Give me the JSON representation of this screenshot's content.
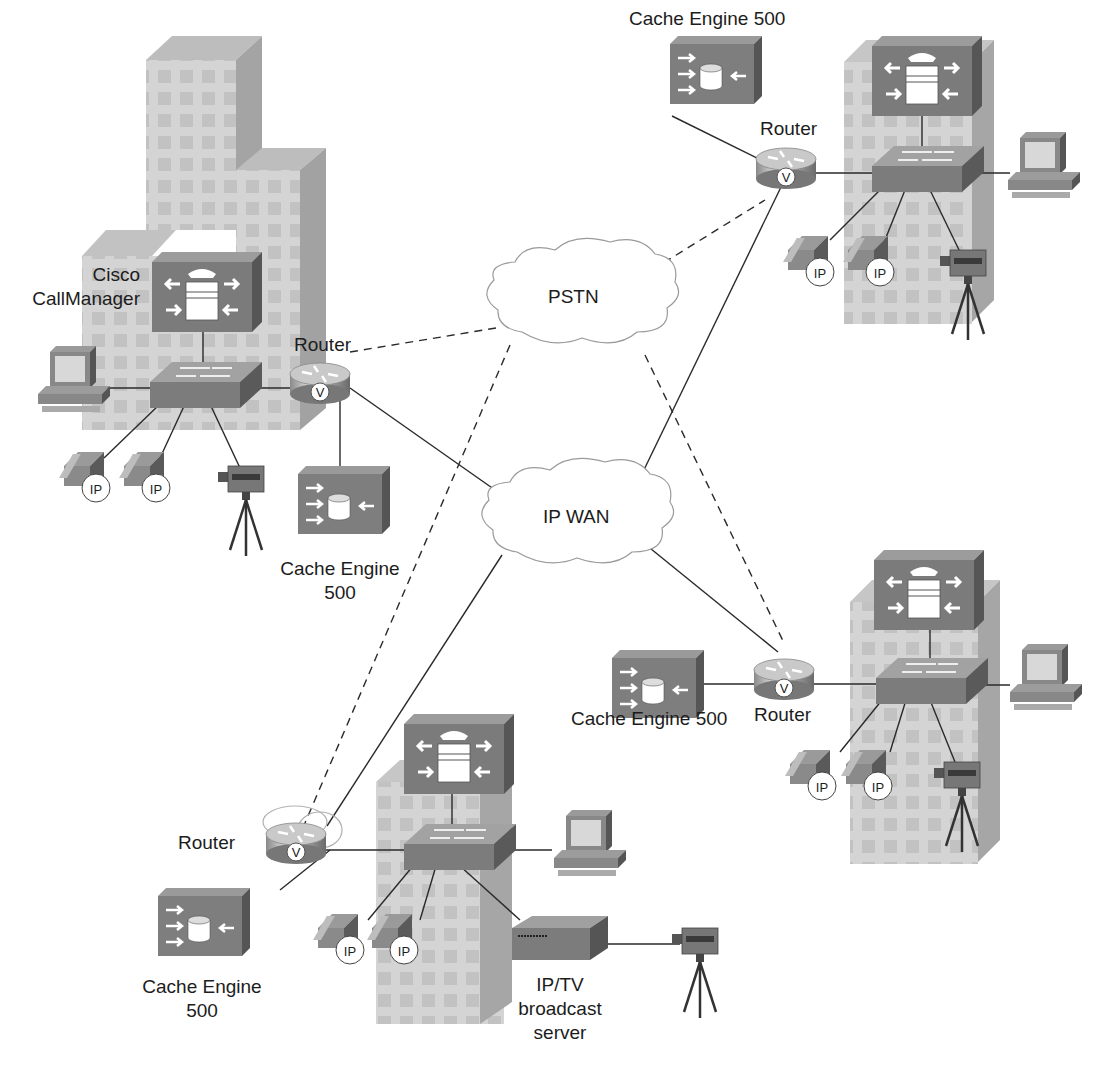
{
  "diagram": {
    "type": "network-topology",
    "clouds": {
      "pstn": {
        "label": "PSTN"
      },
      "ipwan": {
        "label": "IP WAN"
      }
    },
    "sites": {
      "hq": {
        "callmanager_label_line1": "Cisco",
        "callmanager_label_line2": "CallManager",
        "router_label": "Router",
        "router_badge": "V",
        "cache_label_line1": "Cache  Engine",
        "cache_label_line2": "500",
        "phones": [
          {
            "badge": "IP"
          },
          {
            "badge": "IP"
          }
        ]
      },
      "branch_top_right": {
        "cache_label": "Cache  Engine 500",
        "router_label": "Router",
        "router_badge": "V",
        "phones": [
          {
            "badge": "IP"
          },
          {
            "badge": "IP"
          }
        ]
      },
      "branch_mid_right": {
        "cache_label": "Cache  Engine 500",
        "router_label": "Router",
        "router_badge": "V",
        "phones": [
          {
            "badge": "IP"
          },
          {
            "badge": "IP"
          }
        ]
      },
      "branch_bottom": {
        "router_label": "Router",
        "router_badge": "V",
        "cache_label_line1": "Cache  Engine",
        "cache_label_line2": "500",
        "iptv_label_line1": "IP/TV",
        "iptv_label_line2": "broadcast",
        "iptv_label_line3": "server",
        "phones": [
          {
            "badge": "IP"
          },
          {
            "badge": "IP"
          }
        ]
      }
    },
    "links_legend": {
      "solid": "IP WAN link",
      "dashed": "PSTN link"
    },
    "colors": {
      "device_dark": "#7d7d7d",
      "device_side": "#5a5a5a",
      "building_face": "#d2d2d2",
      "building_side": "#a8a8a8",
      "line": "#2a2a2a",
      "cloud_stroke": "#9a9a9a"
    }
  }
}
